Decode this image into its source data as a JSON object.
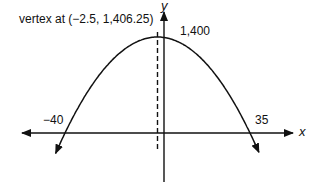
{
  "chart_data": {
    "type": "line",
    "title": "",
    "xlabel": "x",
    "ylabel": "y",
    "function": "quadratic (downward-opening parabola)",
    "vertex": {
      "x": -2.5,
      "y": 1406.25
    },
    "x_intercepts": [
      -40,
      35
    ],
    "y_intercept": 1400,
    "axis_of_symmetry": "x = -2.5 (dashed line)",
    "series": [
      {
        "name": "parabola",
        "x": [
          -44,
          -40,
          -30,
          -20,
          -10,
          -2.5,
          0,
          10,
          20,
          30,
          35,
          39
        ],
        "y": [
          -174,
          0,
          350,
          900,
          1350,
          1406.25,
          1400,
          1250,
          900,
          350,
          0,
          -290
        ]
      }
    ],
    "annotations": [
      {
        "text": "vertex at (−2.5, 1,406.25)",
        "at": {
          "x": -2.5,
          "y": 1406.25
        }
      },
      {
        "text": "1,400",
        "at": {
          "x": 0,
          "y": 1400
        }
      },
      {
        "text": "−40",
        "at": {
          "x": -40,
          "y": 0
        }
      },
      {
        "text": "35",
        "at": {
          "x": 35,
          "y": 0
        }
      }
    ],
    "grid": false,
    "legend": "none"
  },
  "labels": {
    "vertex": "vertex at (−2.5, 1,406.25)",
    "y_intercept": "1,400",
    "x_left_intercept": "−40",
    "x_right_intercept": "35",
    "x_axis": "x",
    "y_axis": "y"
  },
  "colors": {
    "line": "#111111",
    "background": "#ffffff"
  }
}
